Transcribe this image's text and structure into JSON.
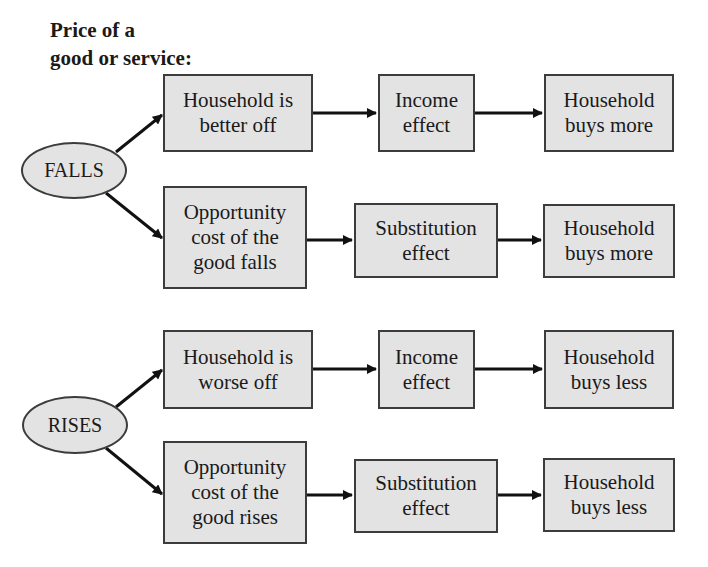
{
  "title": {
    "line1": "Price of a",
    "line2": "good or service:"
  },
  "groups": [
    {
      "trigger": "FALLS",
      "rows": [
        {
          "cause": "Household is better off",
          "effect": "Income effect",
          "result": "Household buys more"
        },
        {
          "cause": "Opportunity cost of the good falls",
          "effect": "Substitution effect",
          "result": "Household buys more"
        }
      ]
    },
    {
      "trigger": "RISES",
      "rows": [
        {
          "cause": "Household is worse off",
          "effect": "Income effect",
          "result": "Household buys less"
        },
        {
          "cause": "Opportunity cost of the good rises",
          "effect": "Substitution effect",
          "result": "Household buys less"
        }
      ]
    }
  ],
  "colors": {
    "box_fill": "#e3e3e3",
    "border": "#3c3c3c",
    "arrow": "#111111"
  }
}
